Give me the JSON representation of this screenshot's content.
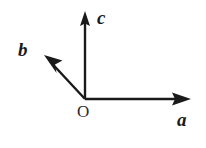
{
  "figure": {
    "name": "crystallographic-axes-diagram",
    "background_color": "#ffffff",
    "stroke_color": "#1a1a1a",
    "width": 206,
    "height": 148
  },
  "origin": {
    "label": "O",
    "x": 85,
    "y": 99
  },
  "axes": [
    {
      "id": "a",
      "label": "a",
      "description": "horizontal axis pointing right",
      "from": {
        "x": 85,
        "y": 99
      },
      "to": {
        "x": 191,
        "y": 99
      },
      "label_position": {
        "x": 177,
        "y": 110
      }
    },
    {
      "id": "b",
      "label": "b",
      "description": "oblique axis pointing up and to the left",
      "from": {
        "x": 85,
        "y": 99
      },
      "to": {
        "x": 44,
        "y": 55
      },
      "label_position": {
        "x": 18,
        "y": 40
      }
    },
    {
      "id": "c",
      "label": "c",
      "description": "vertical axis pointing up",
      "from": {
        "x": 85,
        "y": 99
      },
      "to": {
        "x": 85,
        "y": 11
      },
      "label_position": {
        "x": 97,
        "y": 8
      }
    }
  ]
}
